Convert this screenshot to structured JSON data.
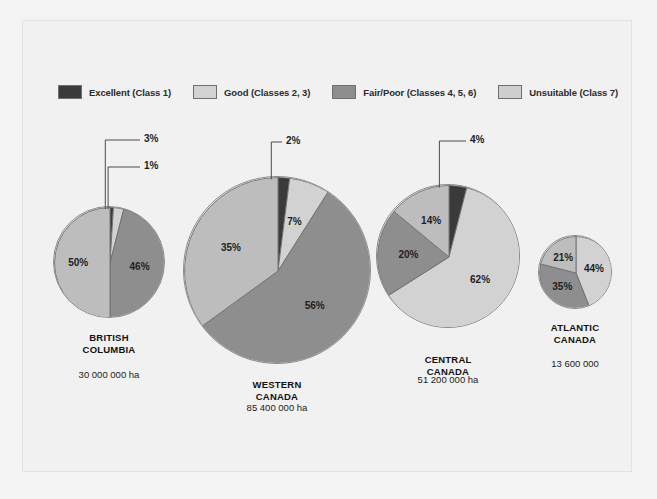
{
  "colors": {
    "background": "#f3f3f3",
    "panel": "#f1f1f1",
    "frame_border": "#e2e2e2",
    "excellent": "#3a3a3a",
    "good": "#d2d2d2",
    "fair_poor": "#8e8e8e",
    "unsuitable": "#bdbdbd",
    "slice_outline": "#6f6f6f",
    "text": "#1a1a1a"
  },
  "legend": {
    "items": [
      {
        "label": "Excellent (Class 1)",
        "key": "excellent",
        "color": "#3a3a3a"
      },
      {
        "label": "Good (Classes 2, 3)",
        "key": "good",
        "color": "#d2d2d2"
      },
      {
        "label": "Fair/Poor (Classes 4, 5, 6)",
        "key": "fair_poor",
        "color": "#8e8e8e"
      },
      {
        "label": "Unsuitable (Class 7)",
        "key": "unsuitable",
        "color": "#bdbdbd"
      }
    ]
  },
  "chart_data": {
    "type": "pie",
    "title": "",
    "subtitle": "",
    "xlabel": "",
    "ylabel": "",
    "legend_position": "top",
    "grid": false,
    "units": "percent of regional land area",
    "categories": [
      "Excellent (Class 1)",
      "Good (Classes 2, 3)",
      "Fair/Poor (Classes 4, 5, 6)",
      "Unsuitable (Class 7)"
    ],
    "charts": [
      {
        "name": "BRITISH\nCOLUMBIA",
        "name_flat": "BRITISH COLUMBIA",
        "area_label": "30 000 000 ha",
        "area_value": 30000000,
        "radius_px": 56,
        "values": [
          1,
          3,
          46,
          50
        ],
        "slices": [
          {
            "category": "Excellent (Class 1)",
            "value": 1,
            "label": "1%",
            "callout": true
          },
          {
            "category": "Good (Classes 2, 3)",
            "value": 3,
            "label": "3%",
            "callout": true
          },
          {
            "category": "Fair/Poor (Classes 4, 5, 6)",
            "value": 46,
            "label": "46%",
            "callout": false
          },
          {
            "category": "Unsuitable (Class 7)",
            "value": 50,
            "label": "50%",
            "callout": false
          }
        ]
      },
      {
        "name": "WESTERN CANADA",
        "name_flat": "WESTERN CANADA",
        "area_label": "85 400 000 ha",
        "area_value": 85400000,
        "radius_px": 94,
        "values": [
          2,
          7,
          56,
          35
        ],
        "slices": [
          {
            "category": "Excellent (Class 1)",
            "value": 2,
            "label": "2%",
            "callout": true
          },
          {
            "category": "Good (Classes 2, 3)",
            "value": 7,
            "label": "7%",
            "callout": false
          },
          {
            "category": "Fair/Poor (Classes 4, 5, 6)",
            "value": 56,
            "label": "56%",
            "callout": false
          },
          {
            "category": "Unsuitable (Class 7)",
            "value": 35,
            "label": "35%",
            "callout": false
          }
        ]
      },
      {
        "name": "CENTRAL CANADA",
        "name_flat": "CENTRAL CANADA",
        "area_label": "51 200 000 ha",
        "area_value": 51200000,
        "radius_px": 72,
        "values": [
          4,
          62,
          20,
          14
        ],
        "slices": [
          {
            "category": "Excellent (Class 1)",
            "value": 4,
            "label": "4%",
            "callout": true
          },
          {
            "category": "Good (Classes 2, 3)",
            "value": 62,
            "label": "62%",
            "callout": false
          },
          {
            "category": "Fair/Poor (Classes 4, 5, 6)",
            "value": 20,
            "label": "20%",
            "callout": false
          },
          {
            "category": "Unsuitable (Class 7)",
            "value": 14,
            "label": "14%",
            "callout": false
          }
        ]
      },
      {
        "name": "ATLANTIC\nCANADA",
        "name_flat": "ATLANTIC CANADA",
        "area_label": "13 600 000",
        "area_value": 13600000,
        "radius_px": 37,
        "values": [
          0,
          44,
          35,
          21
        ],
        "slices": [
          {
            "category": "Good (Classes 2, 3)",
            "value": 44,
            "label": "44%",
            "callout": false
          },
          {
            "category": "Fair/Poor (Classes 4, 5, 6)",
            "value": 35,
            "label": "35%",
            "callout": false
          },
          {
            "category": "Unsuitable (Class 7)",
            "value": 21,
            "label": "21%",
            "callout": false
          }
        ]
      }
    ]
  }
}
